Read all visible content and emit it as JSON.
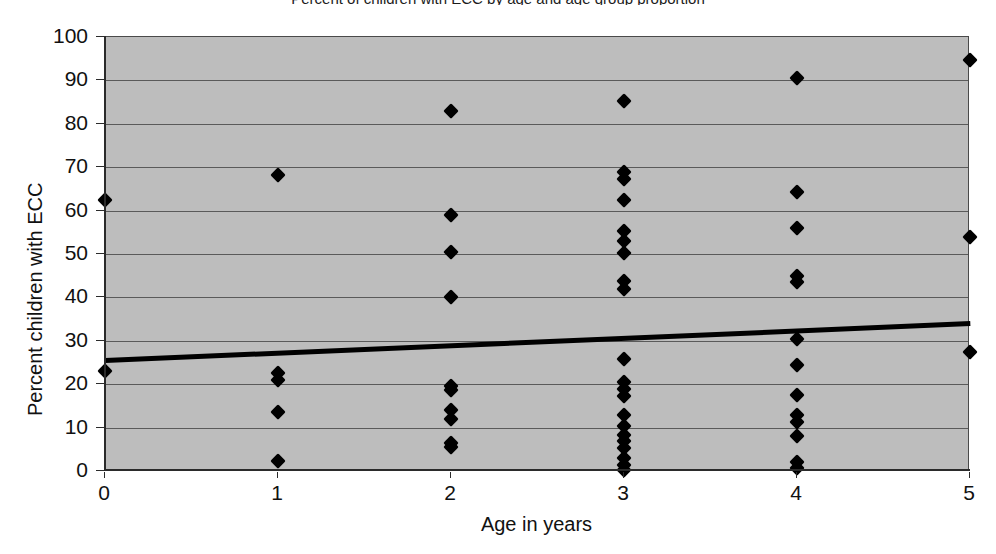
{
  "chart_data": {
    "type": "scatter",
    "title": "Percent of children with ECC by age and age group proportion",
    "xlabel": "Age in years",
    "ylabel": "Percent children with ECC",
    "xlim": [
      0,
      5
    ],
    "ylim": [
      0,
      100
    ],
    "xticks": [
      0,
      1,
      2,
      3,
      4,
      5
    ],
    "yticks": [
      0,
      10,
      20,
      30,
      40,
      50,
      60,
      70,
      80,
      90,
      100
    ],
    "grid": true,
    "legend": "none",
    "plot_background": "#bdbdbd",
    "marker": "diamond",
    "marker_color": "#000000",
    "points": [
      {
        "x": 0,
        "y": 62.5
      },
      {
        "x": 0,
        "y": 23.0
      },
      {
        "x": 1,
        "y": 68.3
      },
      {
        "x": 1,
        "y": 22.6
      },
      {
        "x": 1,
        "y": 21.0
      },
      {
        "x": 1,
        "y": 13.5
      },
      {
        "x": 1,
        "y": 2.2
      },
      {
        "x": 2,
        "y": 83.0
      },
      {
        "x": 2,
        "y": 59.0
      },
      {
        "x": 2,
        "y": 50.5
      },
      {
        "x": 2,
        "y": 40.2
      },
      {
        "x": 2,
        "y": 19.5
      },
      {
        "x": 2,
        "y": 18.6
      },
      {
        "x": 2,
        "y": 14.0
      },
      {
        "x": 2,
        "y": 12.0
      },
      {
        "x": 2,
        "y": 6.5
      },
      {
        "x": 2,
        "y": 5.5
      },
      {
        "x": 3,
        "y": 85.2
      },
      {
        "x": 3,
        "y": 68.8
      },
      {
        "x": 3,
        "y": 67.2
      },
      {
        "x": 3,
        "y": 62.4
      },
      {
        "x": 3,
        "y": 55.2
      },
      {
        "x": 3,
        "y": 53.0
      },
      {
        "x": 3,
        "y": 50.2
      },
      {
        "x": 3,
        "y": 43.8
      },
      {
        "x": 3,
        "y": 42.0
      },
      {
        "x": 3,
        "y": 25.8
      },
      {
        "x": 3,
        "y": 20.4
      },
      {
        "x": 3,
        "y": 18.8
      },
      {
        "x": 3,
        "y": 17.2
      },
      {
        "x": 3,
        "y": 13.0
      },
      {
        "x": 3,
        "y": 10.4
      },
      {
        "x": 3,
        "y": 8.4
      },
      {
        "x": 3,
        "y": 6.8
      },
      {
        "x": 3,
        "y": 5.2
      },
      {
        "x": 3,
        "y": 3.0
      },
      {
        "x": 3,
        "y": 1.4
      },
      {
        "x": 3,
        "y": 0.3
      },
      {
        "x": 4,
        "y": 90.5
      },
      {
        "x": 4,
        "y": 64.2
      },
      {
        "x": 4,
        "y": 56.0
      },
      {
        "x": 4,
        "y": 45.0
      },
      {
        "x": 4,
        "y": 43.6
      },
      {
        "x": 4,
        "y": 30.4
      },
      {
        "x": 4,
        "y": 24.5
      },
      {
        "x": 4,
        "y": 17.4
      },
      {
        "x": 4,
        "y": 13.0
      },
      {
        "x": 4,
        "y": 11.4
      },
      {
        "x": 4,
        "y": 8.0
      },
      {
        "x": 4,
        "y": 2.0
      },
      {
        "x": 4,
        "y": 0.6
      },
      {
        "x": 5,
        "y": 94.6
      },
      {
        "x": 5,
        "y": 54.0
      },
      {
        "x": 5,
        "y": 27.4
      }
    ],
    "trendline": {
      "type": "linear",
      "x_start": 0,
      "y_start": 26.0,
      "x_end": 5,
      "y_end": 34.5,
      "color": "#000000"
    }
  }
}
